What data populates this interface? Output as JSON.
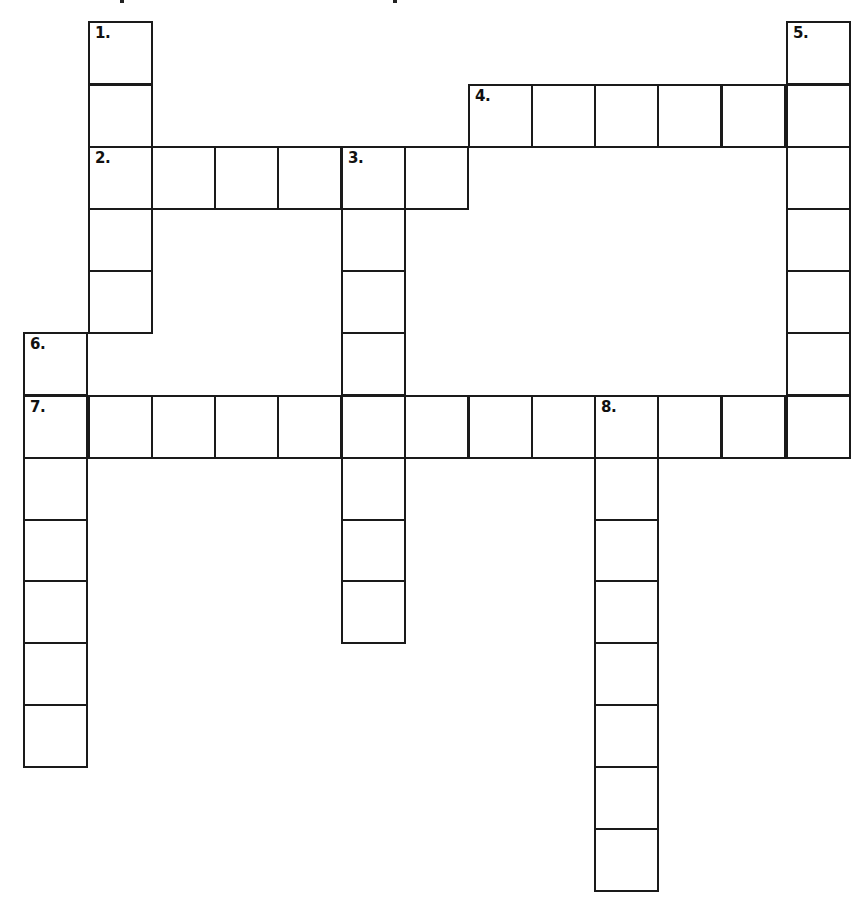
{
  "puzzle": {
    "type": "crossword",
    "cell_size_px": 63,
    "grid_origin": {
      "x": 24,
      "y": 21
    },
    "clue_numbers": [
      "1.",
      "2.",
      "3.",
      "4.",
      "5.",
      "6.",
      "7.",
      "8."
    ],
    "entries": [
      {
        "number": "1.",
        "direction": "down",
        "row": 0,
        "col": 1,
        "length": 5
      },
      {
        "number": "2.",
        "direction": "across",
        "row": 2,
        "col": 1,
        "length": 6
      },
      {
        "number": "3.",
        "direction": "down",
        "row": 2,
        "col": 5,
        "length": 8
      },
      {
        "number": "4.",
        "direction": "across",
        "row": 1,
        "col": 7,
        "length": 6
      },
      {
        "number": "5.",
        "direction": "down",
        "row": 0,
        "col": 12,
        "length": 7
      },
      {
        "number": "6.",
        "direction": "down",
        "row": 5,
        "col": 0,
        "length": 7
      },
      {
        "number": "7.",
        "direction": "across",
        "row": 6,
        "col": 0,
        "length": 13
      },
      {
        "number": "8.",
        "direction": "down",
        "row": 6,
        "col": 9,
        "length": 8
      }
    ],
    "cells_filled": []
  },
  "colors": {
    "grid_line": "#1a1a1a",
    "background": "#ffffff",
    "label": "#111111"
  }
}
